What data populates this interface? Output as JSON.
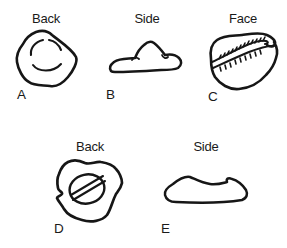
{
  "figure": {
    "background_color": "#ffffff",
    "ink_color": "#161616",
    "panels": [
      {
        "letter": "A",
        "view_label": "Back",
        "drawing": "irregular-rounded-outline-with-two-inner-arcs"
      },
      {
        "letter": "B",
        "view_label": "Side",
        "drawing": "low-mound-profile-outline"
      },
      {
        "letter": "C",
        "view_label": "Face",
        "drawing": "oval-outline-with-toothed-central-slit"
      },
      {
        "letter": "D",
        "view_label": "Back",
        "drawing": "irregular-outline-with-inner-ellipse-and-diagonal-band"
      },
      {
        "letter": "E",
        "view_label": "Side",
        "drawing": "elongated-low-profile-outline"
      }
    ]
  }
}
